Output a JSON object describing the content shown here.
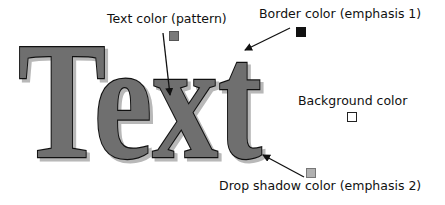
{
  "sample": {
    "text": "Text",
    "colors": {
      "fill": "#6f6f6f",
      "border": "#111111",
      "shadow": "#b8b8b8",
      "background": "#ffffff"
    }
  },
  "callouts": [
    {
      "id": "text-color",
      "label": "Text color (pattern)",
      "swatch": "#7a7a7a"
    },
    {
      "id": "border-color",
      "label": "Border color (emphasis 1)",
      "swatch": "#111111"
    },
    {
      "id": "background-color",
      "label": "Background color",
      "swatch": "#ffffff"
    },
    {
      "id": "drop-shadow-color",
      "label": "Drop shadow color (emphasis 2)",
      "swatch": "#b0b0b0"
    }
  ]
}
